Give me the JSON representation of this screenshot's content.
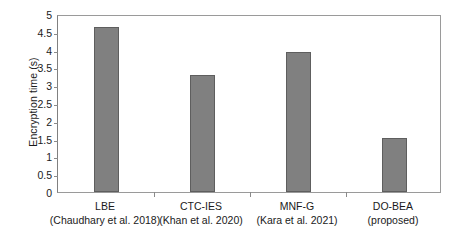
{
  "chart_data": {
    "type": "bar",
    "title": "",
    "xlabel": "",
    "ylabel": "Encryption time (s)",
    "ylim": [
      0,
      5
    ],
    "ytick_values": [
      0,
      0.5,
      1,
      1.5,
      2,
      2.5,
      3,
      3.5,
      4,
      4.5,
      5
    ],
    "ytick_labels": [
      "0",
      "0.5",
      "1",
      "1.5",
      "2",
      "2.5",
      "3",
      "3.5",
      "4",
      "4.5",
      "5"
    ],
    "grid": false,
    "legend": null,
    "bar_color": "#808080",
    "bar_edge_color": "#5e5e5e",
    "categories": [
      "LBE\n(Chaudhary et al. 2018)",
      "CTC-IES\n(Khan et al. 2020)",
      "MNF-G\n(Kara et al. 2021)",
      "DO-BEA\n(proposed)"
    ],
    "category_lines": [
      {
        "line1": "LBE",
        "line2": "(Chaudhary et al. 2018)"
      },
      {
        "line1": "CTC-IES",
        "line2": "(Khan et al. 2020)"
      },
      {
        "line1": "MNF-G",
        "line2": "(Kara et al. 2021)"
      },
      {
        "line1": "DO-BEA",
        "line2": "(proposed)"
      }
    ],
    "values": [
      4.63,
      3.3,
      3.93,
      1.53
    ],
    "series": [
      {
        "name": "Encryption time (s)",
        "values": [
          4.63,
          3.3,
          3.93,
          1.53
        ]
      }
    ]
  }
}
